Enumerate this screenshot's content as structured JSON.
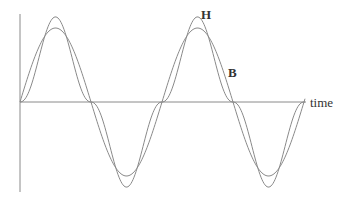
{
  "diagram": {
    "title": "",
    "labels": {
      "h_curve": "H",
      "b_curve": "B",
      "x_axis": "time"
    },
    "colors": {
      "curve": "#8a8a8a",
      "axis": "#8a8a8a",
      "text": "#333333",
      "background": "#ffffff"
    }
  },
  "chart_data": {
    "type": "line",
    "title": "",
    "xlabel": "time",
    "ylabel": "",
    "grid": false,
    "legend": "inline labels",
    "series": [
      {
        "name": "H",
        "shape": "sinusoid",
        "description": "Magnetising field H, pure sine wave, ~2 cycles",
        "x": [
          0,
          0.25,
          0.5,
          0.75,
          1.0,
          1.25,
          1.5,
          1.75,
          2.0
        ],
        "values": [
          0,
          1,
          0,
          -1,
          0,
          1,
          0,
          -1,
          0
        ]
      },
      {
        "name": "B",
        "shape": "distorted (peaked) wave",
        "description": "Flux density B, same period, sharper peaks and flattened near zero crossings",
        "x": [
          0,
          0.1,
          0.25,
          0.4,
          0.5,
          0.6,
          0.75,
          0.9,
          1.0,
          1.1,
          1.25,
          1.4,
          1.5,
          1.6,
          1.75,
          1.9,
          2.0
        ],
        "values": [
          0,
          0.1,
          1.15,
          0.1,
          0,
          -0.1,
          -1.15,
          -0.1,
          0,
          0.1,
          1.15,
          0.1,
          0,
          -0.1,
          -1.15,
          -0.1,
          0
        ]
      }
    ]
  }
}
